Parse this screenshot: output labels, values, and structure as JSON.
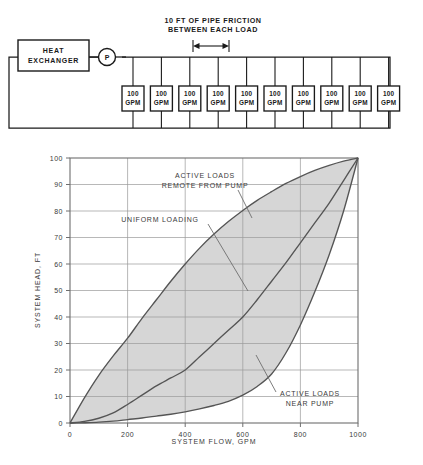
{
  "figure": {
    "schematic": {
      "note_line1": "10 FT OF PIPE FRICTION",
      "note_line2": "BETWEEN EACH LOAD",
      "heat_exchanger_line1": "HEAT",
      "heat_exchanger_line2": "EXCHANGER",
      "pump_label": "P",
      "loads": [
        {
          "value": "100",
          "unit": "GPM"
        },
        {
          "value": "100",
          "unit": "GPM"
        },
        {
          "value": "100",
          "unit": "GPM"
        },
        {
          "value": "100",
          "unit": "GPM"
        },
        {
          "value": "100",
          "unit": "GPM"
        },
        {
          "value": "100",
          "unit": "GPM"
        },
        {
          "value": "100",
          "unit": "GPM"
        },
        {
          "value": "100",
          "unit": "GPM"
        },
        {
          "value": "100",
          "unit": "GPM"
        },
        {
          "value": "100",
          "unit": "GPM"
        }
      ]
    }
  },
  "chart_data": {
    "type": "line",
    "title": "",
    "xlabel": "SYSTEM FLOW, GPM",
    "ylabel": "SYSTEM HEAD, FT",
    "xlim": [
      0,
      1000
    ],
    "ylim": [
      0,
      100
    ],
    "xticks": [
      0,
      200,
      400,
      600,
      800,
      1000
    ],
    "yticks": [
      0,
      10,
      20,
      30,
      40,
      50,
      60,
      70,
      80,
      90,
      100
    ],
    "xtick_labels": [
      "0",
      "200",
      "400",
      "600",
      "800",
      "1000"
    ],
    "ytick_labels": [
      "0",
      "10",
      "20",
      "30",
      "40",
      "50",
      "60",
      "70",
      "80",
      "90",
      "100"
    ],
    "grid": true,
    "legend": "none",
    "fill_between": {
      "upper_series": "ACTIVE LOADS REMOTE FROM PUMP",
      "lower_series": "ACTIVE LOADS NEAR PUMP",
      "color": "#d6d6d6"
    },
    "series": [
      {
        "name": "ACTIVE LOADS REMOTE FROM PUMP",
        "x": [
          0,
          50,
          100,
          150,
          200,
          250,
          300,
          350,
          400,
          450,
          500,
          550,
          600,
          650,
          700,
          750,
          800,
          850,
          900,
          950,
          1000
        ],
        "values": [
          0,
          9.5,
          18.0,
          25.3,
          32.0,
          39.5,
          46.5,
          53.5,
          60.0,
          66.0,
          71.3,
          76.0,
          80.2,
          84.0,
          87.3,
          90.4,
          93.0,
          95.3,
          97.2,
          98.8,
          100
        ]
      },
      {
        "name": "UNIFORM LOADING",
        "x": [
          0,
          50,
          100,
          150,
          200,
          250,
          300,
          350,
          400,
          450,
          500,
          550,
          600,
          650,
          700,
          750,
          800,
          850,
          900,
          950,
          1000
        ],
        "values": [
          0,
          0.6,
          1.8,
          3.8,
          7.0,
          10.5,
          14.0,
          17.0,
          20.0,
          25.0,
          30.0,
          35.0,
          40.0,
          46.5,
          53.5,
          60.5,
          68.0,
          75.5,
          83.0,
          91.5,
          100
        ]
      },
      {
        "name": "ACTIVE LOADS NEAR PUMP",
        "x": [
          0,
          50,
          100,
          150,
          200,
          250,
          300,
          350,
          400,
          450,
          500,
          550,
          600,
          650,
          700,
          750,
          800,
          850,
          900,
          950,
          1000
        ],
        "values": [
          0,
          0.1,
          0.3,
          0.7,
          1.3,
          1.9,
          2.6,
          3.3,
          4.2,
          5.3,
          6.6,
          8.2,
          10.5,
          13.8,
          18.5,
          26.5,
          37.0,
          49.5,
          63.5,
          80.0,
          100
        ]
      }
    ],
    "annotations": [
      {
        "name": "upper-curve-label",
        "line1": "ACTIVE LOADS",
        "line2": "REMOTE FROM PUMP"
      },
      {
        "name": "middle-curve-label",
        "line1": "UNIFORM LOADING",
        "line2": ""
      },
      {
        "name": "lower-curve-label",
        "line1": "ACTIVE LOADS",
        "line2": "NEAR PUMP"
      }
    ]
  },
  "colors": {
    "ink": "#1a1a1a",
    "axis": "#6e6e6e",
    "curve": "#555555",
    "fill": "#d6d6d6",
    "page": "#ffffff"
  }
}
